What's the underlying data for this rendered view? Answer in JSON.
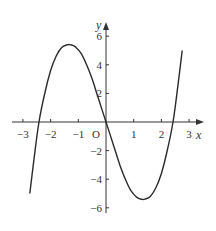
{
  "chart_data": {
    "type": "line",
    "title": "",
    "xlabel": "x",
    "ylabel": "y",
    "origin_label": "O",
    "xlim": [
      -3.3,
      3.5
    ],
    "ylim": [
      -6.5,
      6.9
    ],
    "grid": false,
    "x_ticks": [
      -3,
      -2,
      -1,
      1,
      2,
      3
    ],
    "x_tick_labels": [
      "−3",
      "−2",
      "−1",
      "1",
      "2",
      "3"
    ],
    "y_ticks": [
      6,
      4,
      2,
      -2,
      -4,
      -6
    ],
    "y_tick_labels": [
      "6",
      "4",
      "2",
      "−2",
      "−4",
      "−6"
    ],
    "series": [
      {
        "name": "curve",
        "color": "#2a2a2a",
        "x": [
          -2.75,
          -2.6,
          -2.42,
          -2.2,
          -2.0,
          -1.8,
          -1.6,
          -1.4,
          -1.27,
          -1.1,
          -0.9,
          -0.7,
          -0.5,
          -0.3,
          0.0,
          0.3,
          0.5,
          0.7,
          0.9,
          1.1,
          1.27,
          1.4,
          1.6,
          1.8,
          2.0,
          2.2,
          2.42,
          2.6,
          2.75
        ],
        "y": [
          -5.0,
          -2.6,
          0.0,
          2.1,
          3.6,
          4.6,
          5.2,
          5.4,
          5.4,
          5.25,
          4.8,
          4.0,
          3.0,
          1.8,
          0.0,
          -1.8,
          -3.0,
          -4.0,
          -4.8,
          -5.25,
          -5.4,
          -5.4,
          -5.2,
          -4.6,
          -3.6,
          -2.1,
          0.0,
          2.6,
          5.0
        ]
      }
    ]
  }
}
